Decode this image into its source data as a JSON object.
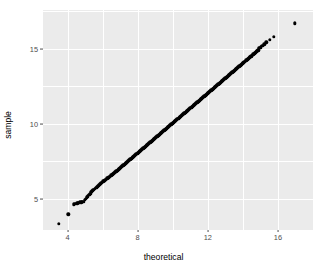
{
  "chart": {
    "type": "scatter",
    "title": "",
    "xlabel": "theoretical",
    "ylabel": "sample",
    "panel_bg": "#ebebeb",
    "grid_color": "#ffffff",
    "point_color": "#000000",
    "tick_text_color": "#4d4d4d"
  },
  "axes": {
    "x": {
      "ticks": [
        {
          "label": "4",
          "value": 4
        },
        {
          "label": "8",
          "value": 8
        },
        {
          "label": "12",
          "value": 12
        },
        {
          "label": "16",
          "value": 16
        }
      ],
      "minor_values": [
        2,
        6,
        10,
        14,
        18
      ],
      "range": [
        2.6,
        18.0
      ]
    },
    "y": {
      "ticks": [
        {
          "label": "5",
          "value": 5
        },
        {
          "label": "10",
          "value": 10
        },
        {
          "label": "15",
          "value": 15
        }
      ],
      "minor_values": [
        2.5,
        7.5,
        12.5,
        17.5
      ],
      "range": [
        2.9,
        17.6
      ]
    }
  },
  "chart_data": {
    "type": "scatter",
    "title": "",
    "xlabel": "theoretical",
    "ylabel": "sample",
    "xlim": [
      2.6,
      18.0
    ],
    "ylim": [
      2.9,
      17.6
    ],
    "xticks": [
      4,
      8,
      12,
      16
    ],
    "yticks": [
      5,
      10,
      15
    ],
    "grid": true,
    "legend": "none",
    "series": [
      {
        "name": "qq-points",
        "x": [
          3.5,
          4.05,
          4.35,
          4.45,
          4.55,
          4.62,
          4.7,
          4.78,
          4.85,
          4.92,
          4.99,
          5.05,
          5.11,
          5.17,
          5.23,
          5.29,
          5.34,
          5.4,
          5.45,
          5.5,
          5.56,
          5.61,
          5.66,
          5.71,
          5.76,
          5.81,
          5.86,
          5.91,
          5.95,
          6.0,
          6.05,
          6.09,
          6.14,
          6.18,
          6.23,
          6.27,
          6.32,
          6.36,
          6.4,
          6.45,
          6.49,
          6.53,
          6.58,
          6.62,
          6.66,
          6.7,
          6.74,
          6.78,
          6.83,
          6.87,
          6.91,
          6.95,
          6.99,
          7.03,
          7.07,
          7.11,
          7.15,
          7.19,
          7.23,
          7.27,
          7.31,
          7.35,
          7.39,
          7.43,
          7.47,
          7.51,
          7.55,
          7.59,
          7.63,
          7.67,
          7.71,
          7.75,
          7.79,
          7.83,
          7.87,
          7.91,
          7.95,
          7.99,
          8.03,
          8.07,
          8.11,
          8.15,
          8.19,
          8.23,
          8.27,
          8.31,
          8.35,
          8.39,
          8.43,
          8.47,
          8.51,
          8.55,
          8.59,
          8.63,
          8.67,
          8.71,
          8.75,
          8.79,
          8.83,
          8.87,
          8.91,
          8.95,
          8.99,
          9.03,
          9.07,
          9.11,
          9.15,
          9.19,
          9.23,
          9.27,
          9.31,
          9.35,
          9.39,
          9.43,
          9.47,
          9.51,
          9.55,
          9.59,
          9.63,
          9.67,
          9.71,
          9.75,
          9.79,
          9.83,
          9.87,
          9.91,
          9.95,
          9.99,
          10.03,
          10.07,
          10.11,
          10.15,
          10.19,
          10.23,
          10.27,
          10.31,
          10.35,
          10.39,
          10.43,
          10.47,
          10.51,
          10.55,
          10.59,
          10.63,
          10.67,
          10.71,
          10.75,
          10.79,
          10.83,
          10.87,
          10.91,
          10.95,
          10.99,
          11.03,
          11.07,
          11.11,
          11.15,
          11.19,
          11.23,
          11.27,
          11.31,
          11.35,
          11.39,
          11.43,
          11.47,
          11.51,
          11.55,
          11.59,
          11.63,
          11.67,
          11.71,
          11.75,
          11.79,
          11.83,
          11.87,
          11.91,
          11.95,
          11.99,
          12.03,
          12.07,
          12.11,
          12.15,
          12.19,
          12.23,
          12.27,
          12.31,
          12.35,
          12.39,
          12.43,
          12.47,
          12.51,
          12.55,
          12.59,
          12.63,
          12.67,
          12.71,
          12.75,
          12.79,
          12.83,
          12.87,
          12.91,
          12.95,
          12.99,
          13.03,
          13.07,
          13.11,
          13.15,
          13.19,
          13.23,
          13.27,
          13.31,
          13.35,
          13.39,
          13.43,
          13.47,
          13.51,
          13.55,
          13.59,
          13.63,
          13.67,
          13.71,
          13.75,
          13.79,
          13.83,
          13.87,
          13.91,
          13.95,
          13.99,
          14.03,
          14.07,
          14.11,
          14.15,
          14.19,
          14.23,
          14.27,
          14.31,
          14.35,
          14.39,
          14.43,
          14.47,
          14.51,
          14.55,
          14.59,
          14.63,
          14.67,
          14.71,
          14.75,
          14.79,
          14.83,
          14.87,
          14.92,
          14.97,
          15.02,
          15.1,
          15.22,
          15.33,
          15.52,
          15.78,
          16.95
        ],
        "y": [
          3.3,
          3.95,
          4.62,
          4.66,
          4.69,
          4.72,
          4.74,
          4.76,
          4.78,
          4.8,
          4.92,
          5.0,
          5.08,
          5.16,
          5.25,
          5.33,
          5.41,
          5.48,
          5.55,
          5.6,
          5.65,
          5.7,
          5.75,
          5.8,
          5.86,
          5.92,
          5.98,
          6.03,
          6.07,
          6.11,
          6.15,
          6.19,
          6.23,
          6.27,
          6.31,
          6.35,
          6.39,
          6.43,
          6.47,
          6.51,
          6.55,
          6.59,
          6.63,
          6.67,
          6.71,
          6.75,
          6.79,
          6.83,
          6.87,
          6.91,
          6.95,
          6.99,
          7.03,
          7.07,
          7.11,
          7.15,
          7.19,
          7.23,
          7.27,
          7.31,
          7.35,
          7.39,
          7.43,
          7.47,
          7.51,
          7.55,
          7.59,
          7.63,
          7.67,
          7.71,
          7.75,
          7.79,
          7.83,
          7.87,
          7.91,
          7.95,
          7.99,
          8.03,
          8.07,
          8.11,
          8.15,
          8.19,
          8.23,
          8.27,
          8.31,
          8.35,
          8.39,
          8.43,
          8.47,
          8.51,
          8.55,
          8.59,
          8.63,
          8.67,
          8.71,
          8.75,
          8.79,
          8.83,
          8.87,
          8.91,
          8.95,
          8.99,
          9.03,
          9.07,
          9.11,
          9.15,
          9.19,
          9.23,
          9.27,
          9.31,
          9.35,
          9.39,
          9.43,
          9.47,
          9.51,
          9.55,
          9.59,
          9.63,
          9.67,
          9.71,
          9.75,
          9.79,
          9.83,
          9.87,
          9.91,
          9.95,
          9.99,
          10.03,
          10.07,
          10.11,
          10.15,
          10.19,
          10.23,
          10.27,
          10.31,
          10.35,
          10.39,
          10.43,
          10.47,
          10.51,
          10.55,
          10.59,
          10.63,
          10.67,
          10.71,
          10.75,
          10.79,
          10.83,
          10.87,
          10.91,
          10.95,
          10.99,
          11.03,
          11.07,
          11.11,
          11.15,
          11.19,
          11.23,
          11.27,
          11.31,
          11.35,
          11.39,
          11.43,
          11.47,
          11.51,
          11.55,
          11.59,
          11.63,
          11.67,
          11.71,
          11.75,
          11.79,
          11.83,
          11.87,
          11.91,
          11.95,
          11.99,
          12.03,
          12.07,
          12.11,
          12.15,
          12.19,
          12.23,
          12.27,
          12.31,
          12.35,
          12.39,
          12.43,
          12.47,
          12.51,
          12.55,
          12.59,
          12.63,
          12.67,
          12.71,
          12.75,
          12.79,
          12.83,
          12.87,
          12.91,
          12.95,
          12.99,
          13.03,
          13.07,
          13.11,
          13.15,
          13.19,
          13.23,
          13.27,
          13.31,
          13.35,
          13.39,
          13.43,
          13.47,
          13.51,
          13.55,
          13.59,
          13.63,
          13.67,
          13.71,
          13.75,
          13.79,
          13.83,
          13.87,
          13.91,
          13.95,
          13.99,
          14.03,
          14.07,
          14.11,
          14.15,
          14.19,
          14.23,
          14.27,
          14.31,
          14.35,
          14.39,
          14.43,
          14.47,
          14.51,
          14.55,
          14.59,
          14.63,
          14.67,
          14.71,
          14.75,
          14.79,
          14.83,
          14.87,
          14.91,
          15.05,
          15.08,
          15.1,
          15.2,
          15.3,
          15.45,
          15.62,
          15.8,
          16.7
        ]
      }
    ]
  }
}
